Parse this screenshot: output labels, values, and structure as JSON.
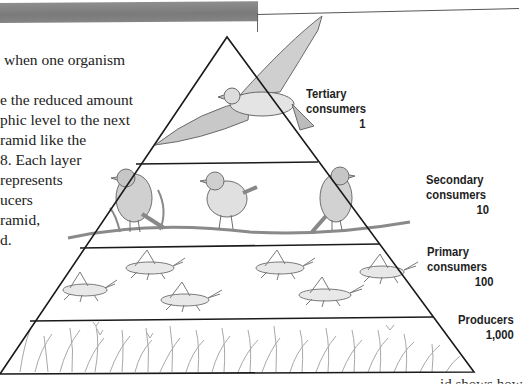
{
  "page": {
    "header_bar_color": "#808080"
  },
  "body_text": {
    "lines": [
      "when one organism",
      "",
      "e the reduced amount",
      "phic level to the next",
      "ramid like the",
      "8. Each layer",
      "represents",
      "ucers",
      "ramid,",
      "d."
    ]
  },
  "figure": {
    "type": "energy pyramid",
    "levels": [
      {
        "name": "Tertiary consumers",
        "label_line1": "Tertiary",
        "label_line2": "consumers",
        "value": "1",
        "organism": "hawk"
      },
      {
        "name": "Secondary consumers",
        "label_line1": "Secondary",
        "label_line2": "consumers",
        "value": "10",
        "organism": "sparrows"
      },
      {
        "name": "Primary consumers",
        "label_line1": "Primary",
        "label_line2": "consumers",
        "value": "100",
        "organism": "grasshoppers"
      },
      {
        "name": "Producers",
        "label_line1": "Producers",
        "label_line2": "",
        "value": "1,000",
        "organism": "grass"
      }
    ]
  },
  "caption": {
    "partial_text": "id shows how"
  }
}
